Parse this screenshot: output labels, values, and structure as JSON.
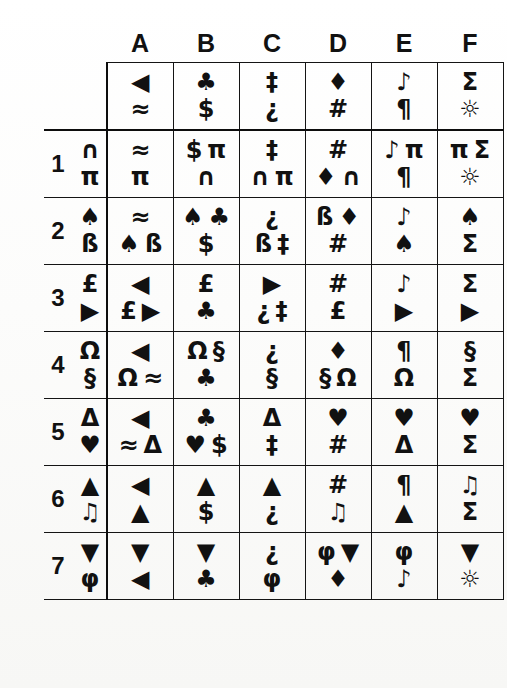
{
  "table": {
    "column_headers": [
      "A",
      "B",
      "C",
      "D",
      "E",
      "F"
    ],
    "row_labels": [
      "1",
      "2",
      "3",
      "4",
      "5",
      "6",
      "7"
    ],
    "key_row": {
      "label_top": "",
      "label_bottom": "",
      "cells": [
        {
          "top": "◀",
          "bottom": "≈"
        },
        {
          "top": "♣",
          "bottom": "$"
        },
        {
          "top": "‡",
          "bottom": "¿"
        },
        {
          "top": "♦",
          "bottom": "#"
        },
        {
          "top": "♪",
          "bottom": "¶"
        },
        {
          "top": "Σ",
          "bottom": "☼"
        }
      ]
    },
    "rows": [
      {
        "number": "1",
        "label": {
          "top": "∩",
          "bottom": "π"
        },
        "cells": [
          {
            "top": "≈",
            "bottom": "π"
          },
          {
            "top": "$ π",
            "bottom": "∩"
          },
          {
            "top": "‡",
            "bottom": "∩ π"
          },
          {
            "top": "#",
            "bottom": "♦ ∩"
          },
          {
            "top": "♪ π",
            "bottom": "¶"
          },
          {
            "top": "π Σ",
            "bottom": "☼"
          }
        ]
      },
      {
        "number": "2",
        "label": {
          "top": "♠",
          "bottom": "ß"
        },
        "cells": [
          {
            "top": "≈",
            "bottom": "♠ ß"
          },
          {
            "top": "♠ ♣",
            "bottom": "$"
          },
          {
            "top": "¿",
            "bottom": "ß ‡"
          },
          {
            "top": "ß ♦",
            "bottom": "#"
          },
          {
            "top": "♪",
            "bottom": "♠"
          },
          {
            "top": "♠",
            "bottom": "Σ"
          }
        ]
      },
      {
        "number": "3",
        "label": {
          "top": "£",
          "bottom": "▶"
        },
        "cells": [
          {
            "top": "◀",
            "bottom": "£ ▶"
          },
          {
            "top": "£",
            "bottom": "♣"
          },
          {
            "top": "▶",
            "bottom": "¿ ‡"
          },
          {
            "top": "#",
            "bottom": "£"
          },
          {
            "top": "♪",
            "bottom": "▶"
          },
          {
            "top": "Σ",
            "bottom": "▶"
          }
        ]
      },
      {
        "number": "4",
        "label": {
          "top": "Ω",
          "bottom": "§"
        },
        "cells": [
          {
            "top": "◀",
            "bottom": "Ω ≈"
          },
          {
            "top": "Ω §",
            "bottom": "♣"
          },
          {
            "top": "¿",
            "bottom": "§"
          },
          {
            "top": "♦",
            "bottom": "§ Ω"
          },
          {
            "top": "¶",
            "bottom": "Ω"
          },
          {
            "top": "§",
            "bottom": "Σ"
          }
        ]
      },
      {
        "number": "5",
        "label": {
          "top": "Δ",
          "bottom": "♥"
        },
        "cells": [
          {
            "top": "◀",
            "bottom": "≈ Δ"
          },
          {
            "top": "♣",
            "bottom": "♥ $"
          },
          {
            "top": "Δ",
            "bottom": "‡"
          },
          {
            "top": "♥",
            "bottom": "#"
          },
          {
            "top": "♥",
            "bottom": "Δ"
          },
          {
            "top": "♥",
            "bottom": "Σ"
          }
        ]
      },
      {
        "number": "6",
        "label": {
          "top": "▲",
          "bottom": "♫"
        },
        "cells": [
          {
            "top": "◀",
            "bottom": "▲"
          },
          {
            "top": "▲",
            "bottom": "$"
          },
          {
            "top": "▲",
            "bottom": "¿"
          },
          {
            "top": "#",
            "bottom": "♫"
          },
          {
            "top": "¶",
            "bottom": "▲"
          },
          {
            "top": "♫",
            "bottom": "Σ"
          }
        ]
      },
      {
        "number": "7",
        "label": {
          "top": "▼",
          "bottom": "φ"
        },
        "cells": [
          {
            "top": "▼",
            "bottom": "◀"
          },
          {
            "top": "▼",
            "bottom": "♣"
          },
          {
            "top": "¿",
            "bottom": "φ"
          },
          {
            "top": "φ ▼",
            "bottom": "♦"
          },
          {
            "top": "φ",
            "bottom": "♪"
          },
          {
            "top": "▼",
            "bottom": "☼"
          }
        ]
      }
    ]
  },
  "style": {
    "ink_color": "#141414",
    "paper_color": "#fdfdfc"
  }
}
